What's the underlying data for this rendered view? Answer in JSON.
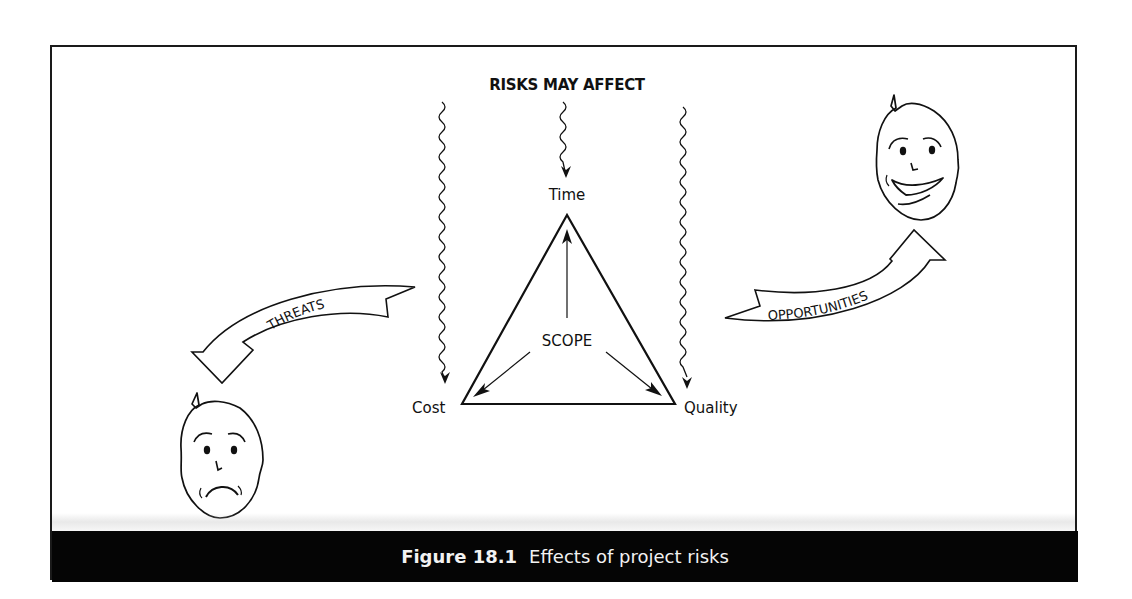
{
  "figure": {
    "heading": "RISKS MAY AFFECT",
    "vertices": {
      "top": "Time",
      "left": "Cost",
      "right": "Quality"
    },
    "center_label": "SCOPE",
    "threats_label": "THREATS",
    "opportunities_label": "OPPORTUNITIES",
    "caption": {
      "number": "Figure 18.1",
      "text": "Effects of project risks"
    },
    "icons": {
      "sad_face": "sad-face-icon",
      "happy_face": "happy-face-icon"
    },
    "colors": {
      "ink": "#111111",
      "caption_background": "#050505",
      "caption_text": "#f2f2f2",
      "background": "#ffffff"
    }
  }
}
